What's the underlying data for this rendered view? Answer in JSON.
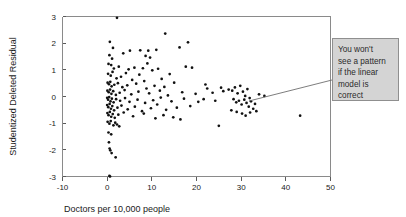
{
  "chart_data": {
    "type": "scatter",
    "title": "",
    "xlabel": "Doctors per 10,000 people",
    "ylabel": "Studentized Deleted Residual",
    "xlim": [
      -10,
      50
    ],
    "ylim": [
      -3,
      3
    ],
    "xticks": [
      -10,
      0,
      10,
      20,
      30,
      40,
      50
    ],
    "yticks": [
      3,
      2,
      1,
      0,
      -1,
      -2,
      -3
    ],
    "xtick_labels": [
      "-10",
      "0",
      "10",
      "20",
      "30",
      "40",
      "50"
    ],
    "ytick_labels": [
      "3",
      "2",
      "1",
      "0",
      "-1",
      "-2",
      "-3"
    ],
    "grid": false,
    "legend": null,
    "series": [
      {
        "name": "Studentized deleted residuals",
        "marker": "dot",
        "color": "#111111",
        "points": [
          [
            2.2,
            2.95
          ],
          [
            0.6,
            2.05
          ],
          [
            1.3,
            1.82
          ],
          [
            5.1,
            1.72
          ],
          [
            7.4,
            1.73
          ],
          [
            9.2,
            1.72
          ],
          [
            11.0,
            1.75
          ],
          [
            13.0,
            2.36
          ],
          [
            16.2,
            1.84
          ],
          [
            18.1,
            2.03
          ],
          [
            0.5,
            1.55
          ],
          [
            1.1,
            1.42
          ],
          [
            3.6,
            1.62
          ],
          [
            8.6,
            1.52
          ],
          [
            9.6,
            1.46
          ],
          [
            0.3,
            1.22
          ],
          [
            0.9,
            1.18
          ],
          [
            1.5,
            1.05
          ],
          [
            2.6,
            1.12
          ],
          [
            4.8,
            1.02
          ],
          [
            6.1,
            1.08
          ],
          [
            8.0,
            1.06
          ],
          [
            9.0,
            1.24
          ],
          [
            10.1,
            0.98
          ],
          [
            11.4,
            1.04
          ],
          [
            17.6,
            1.12
          ],
          [
            19.0,
            1.08
          ],
          [
            0.2,
            0.85
          ],
          [
            0.8,
            0.78
          ],
          [
            1.2,
            0.92
          ],
          [
            2.1,
            0.68
          ],
          [
            3.1,
            0.74
          ],
          [
            4.2,
            0.88
          ],
          [
            5.6,
            0.62
          ],
          [
            7.2,
            0.82
          ],
          [
            8.3,
            0.58
          ],
          [
            12.2,
            0.66
          ],
          [
            14.0,
            0.84
          ],
          [
            0.1,
            0.52
          ],
          [
            0.4,
            0.46
          ],
          [
            0.7,
            0.55
          ],
          [
            1.0,
            0.38
          ],
          [
            1.6,
            0.44
          ],
          [
            2.4,
            0.5
          ],
          [
            3.4,
            0.35
          ],
          [
            4.5,
            0.42
          ],
          [
            6.5,
            0.48
          ],
          [
            8.8,
            0.3
          ],
          [
            10.6,
            0.4
          ],
          [
            12.8,
            0.36
          ],
          [
            15.0,
            0.52
          ],
          [
            22.0,
            0.45
          ],
          [
            22.4,
            0.3
          ],
          [
            25.5,
            0.33
          ],
          [
            0.05,
            0.22
          ],
          [
            0.35,
            0.16
          ],
          [
            0.65,
            0.26
          ],
          [
            0.95,
            0.1
          ],
          [
            1.35,
            0.2
          ],
          [
            1.95,
            0.06
          ],
          [
            2.8,
            0.14
          ],
          [
            3.9,
            0.24
          ],
          [
            5.4,
            0.08
          ],
          [
            7.0,
            0.18
          ],
          [
            9.4,
            0.12
          ],
          [
            11.8,
            0.22
          ],
          [
            13.6,
            0.04
          ],
          [
            16.8,
            0.16
          ],
          [
            19.8,
            0.1
          ],
          [
            23.6,
            0.14
          ],
          [
            26.0,
            0.2
          ],
          [
            27.2,
            0.26
          ],
          [
            0.0,
            -0.05
          ],
          [
            0.2,
            -0.12
          ],
          [
            0.45,
            -0.02
          ],
          [
            0.75,
            -0.18
          ],
          [
            1.05,
            -0.08
          ],
          [
            1.45,
            -0.22
          ],
          [
            2.0,
            -0.1
          ],
          [
            2.9,
            -0.16
          ],
          [
            4.0,
            -0.06
          ],
          [
            5.0,
            -0.2
          ],
          [
            6.8,
            -0.12
          ],
          [
            8.5,
            -0.24
          ],
          [
            10.3,
            -0.14
          ],
          [
            12.0,
            -0.04
          ],
          [
            14.4,
            -0.18
          ],
          [
            17.2,
            -0.08
          ],
          [
            20.4,
            -0.2
          ],
          [
            21.6,
            -0.1
          ],
          [
            24.2,
            -0.16
          ],
          [
            28.0,
            0.22
          ],
          [
            28.6,
            0.34
          ],
          [
            29.2,
            0.12
          ],
          [
            29.8,
            0.4
          ],
          [
            30.4,
            0.18
          ],
          [
            30.9,
            0.02
          ],
          [
            31.4,
            0.28
          ],
          [
            31.9,
            -0.06
          ],
          [
            28.3,
            -0.1
          ],
          [
            28.9,
            -0.22
          ],
          [
            29.5,
            -0.16
          ],
          [
            30.1,
            -0.3
          ],
          [
            30.7,
            -0.12
          ],
          [
            31.2,
            -0.24
          ],
          [
            31.7,
            -0.38
          ],
          [
            32.2,
            -0.18
          ],
          [
            32.7,
            -0.46
          ],
          [
            33.1,
            -0.28
          ],
          [
            27.8,
            -0.52
          ],
          [
            29.0,
            -0.58
          ],
          [
            30.2,
            -0.64
          ],
          [
            31.0,
            -0.72
          ],
          [
            32.0,
            -0.6
          ],
          [
            33.4,
            -0.55
          ],
          [
            0.0,
            -0.32
          ],
          [
            0.25,
            -0.4
          ],
          [
            0.55,
            -0.28
          ],
          [
            0.85,
            -0.46
          ],
          [
            1.15,
            -0.36
          ],
          [
            1.55,
            -0.52
          ],
          [
            2.3,
            -0.42
          ],
          [
            3.2,
            -0.34
          ],
          [
            4.6,
            -0.48
          ],
          [
            6.2,
            -0.38
          ],
          [
            7.8,
            -0.55
          ],
          [
            9.8,
            -0.44
          ],
          [
            11.2,
            -0.3
          ],
          [
            13.2,
            -0.5
          ],
          [
            15.6,
            -0.42
          ],
          [
            18.6,
            -0.36
          ],
          [
            0.05,
            -0.62
          ],
          [
            0.3,
            -0.7
          ],
          [
            0.6,
            -0.58
          ],
          [
            0.9,
            -0.76
          ],
          [
            1.25,
            -0.66
          ],
          [
            1.7,
            -0.8
          ],
          [
            2.5,
            -0.68
          ],
          [
            3.7,
            -0.6
          ],
          [
            5.8,
            -0.74
          ],
          [
            8.2,
            -0.64
          ],
          [
            10.8,
            -0.82
          ],
          [
            12.6,
            -0.7
          ],
          [
            14.8,
            -0.78
          ],
          [
            16.4,
            -0.86
          ],
          [
            0.1,
            -0.95
          ],
          [
            0.5,
            -1.02
          ],
          [
            0.8,
            -0.92
          ],
          [
            1.4,
            -1.08
          ],
          [
            1.8,
            -0.98
          ],
          [
            2.2,
            -1.05
          ],
          [
            2.7,
            -1.12
          ],
          [
            25.0,
            -1.1
          ],
          [
            0.3,
            -1.35
          ],
          [
            0.9,
            -1.42
          ],
          [
            0.4,
            -1.72
          ],
          [
            0.55,
            -1.95
          ],
          [
            0.7,
            -2.02
          ],
          [
            1.0,
            -2.12
          ],
          [
            1.9,
            -2.28
          ],
          [
            0.5,
            -2.98
          ],
          [
            0.65,
            -3.0
          ],
          [
            43.2,
            -0.72
          ],
          [
            34.0,
            0.08
          ],
          [
            35.2,
            0.02
          ]
        ]
      }
    ],
    "annotations": [
      {
        "name": "pattern-callout",
        "text": "You won't see a pattern if the linear model is correct",
        "lines": [
          "You won't",
          "see a pattern",
          "if the linear",
          "model is",
          "correct"
        ],
        "box_color": "#d4d4d4",
        "border_color": "#8f8f8f",
        "leader_from": [
          332,
          80
        ],
        "leader_to": [
          249,
          101
        ]
      }
    ]
  },
  "axes": {
    "x_label": "Doctors per 10,000 people",
    "y_label": "Studentized Deleted Residual"
  }
}
